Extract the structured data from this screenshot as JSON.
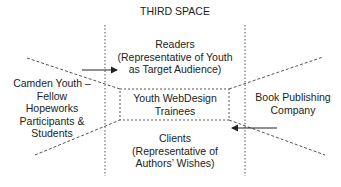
{
  "title": "THIRD SPACE",
  "nodes": {
    "readers": "Readers\n(Representative of Youth\nas Target Audience)",
    "center": "Youth WebDesign\nTrainees",
    "clients": "Clients\n(Representative of\nAuthors’ Wishes)",
    "left": "Camden Youth –\nFellow\nHopeworks\nParticipants &\nStudents",
    "right": "Book Publishing\nCompany"
  },
  "colors": {
    "line": "#333333",
    "background": "#ffffff"
  }
}
